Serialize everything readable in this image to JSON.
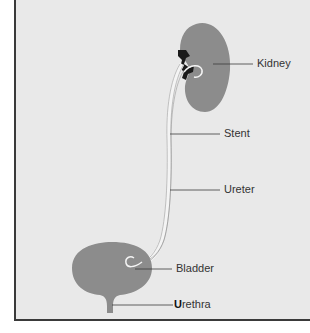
{
  "diagram": {
    "labels": {
      "kidney": "Kidney",
      "stent": "Stent",
      "ureter": "Ureter",
      "bladder": "Bladder",
      "urethra_first": "U",
      "urethra_rest": "rethra"
    },
    "colors": {
      "background": "#e9e9e9",
      "organ": "#8c8c8c",
      "stent": "#f4f4f4",
      "outline": "#3a3a3a",
      "pelvis": "#1a1a1a"
    }
  }
}
